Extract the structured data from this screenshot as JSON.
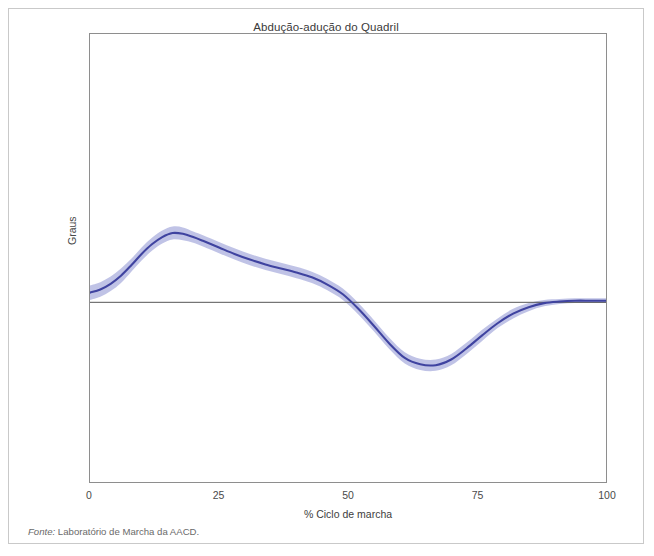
{
  "figure": {
    "title": "Abdução-adução do Quadril",
    "source_lead": "Fonte:",
    "source_text": " Laboratório de Marcha da AACD.",
    "clipped_caption": "",
    "frame_color": "#c9c9c9",
    "axis_color": "#8e8e8e"
  },
  "chart_data": {
    "type": "line",
    "title": "Abdução-adução do Quadril",
    "xlabel": "% Ciclo de marcha",
    "ylabel": "Graus",
    "grid": false,
    "legend": false,
    "xlim": [
      0,
      100
    ],
    "ylim": [
      -22.3,
      33.3
    ],
    "xticks": [
      0,
      25,
      50,
      75,
      100
    ],
    "xtick_labels": [
      "0",
      "25",
      "50",
      "75",
      "100"
    ],
    "yticks": [
      0
    ],
    "ytick_labels": [
      ""
    ],
    "zero_line": 0,
    "line_color": "#3f43a0",
    "band_color": "#b5b8e2",
    "zero_line_color": "#555555",
    "series": [
      {
        "name": "Abdução-adução do quadril (média)",
        "x": [
          0,
          2,
          4,
          6,
          8,
          10,
          12,
          14,
          16,
          18,
          20,
          22,
          25,
          28,
          31,
          34,
          37,
          40,
          43,
          46,
          49,
          52,
          55,
          58,
          61,
          64,
          67,
          70,
          73,
          76,
          79,
          82,
          85,
          88,
          91,
          94,
          97,
          100
        ],
        "values": [
          1.2,
          1.6,
          2.3,
          3.3,
          4.6,
          6.0,
          7.2,
          8.1,
          8.6,
          8.5,
          8.1,
          7.6,
          6.8,
          6.0,
          5.3,
          4.7,
          4.2,
          3.7,
          3.1,
          2.2,
          1.0,
          -0.8,
          -2.9,
          -5.1,
          -6.9,
          -7.7,
          -7.8,
          -7.1,
          -5.7,
          -4.1,
          -2.6,
          -1.4,
          -0.6,
          -0.1,
          0.1,
          0.2,
          0.2,
          0.2
        ],
        "band_half_width": [
          0.9,
          0.9,
          0.9,
          0.9,
          0.8,
          0.8,
          0.8,
          0.8,
          0.8,
          0.8,
          0.7,
          0.7,
          0.7,
          0.7,
          0.7,
          0.7,
          0.7,
          0.7,
          0.7,
          0.7,
          0.7,
          0.7,
          0.7,
          0.7,
          0.7,
          0.7,
          0.7,
          0.7,
          0.7,
          0.7,
          0.6,
          0.6,
          0.5,
          0.4,
          0.3,
          0.3,
          0.3,
          0.3
        ]
      }
    ],
    "annotations": []
  }
}
